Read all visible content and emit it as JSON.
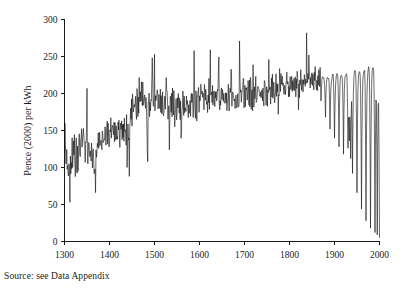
{
  "source_note": "Source: see Data Appendix",
  "chart_data": {
    "type": "line",
    "title": "",
    "subtitle": "",
    "xlabel": "",
    "ylabel": "Pence (2000) per kWh",
    "xlim": [
      1300,
      2000
    ],
    "ylim": [
      0,
      300
    ],
    "xticks": [
      1300,
      1400,
      1500,
      1600,
      1700,
      1800,
      1900,
      2000
    ],
    "yticks": [
      0,
      50,
      100,
      150,
      200,
      250,
      300
    ],
    "grid": false,
    "legend": null,
    "legend_position": "none",
    "line_color": "#111111",
    "annotations": [],
    "series": [
      {
        "name": "Real price of energy",
        "x_start": 1300,
        "x_step": 1,
        "values": [
          118,
          160,
          125,
          112,
          122,
          108,
          101,
          97,
          106,
          99,
          100,
          95,
          53,
          100,
          104,
          113,
          96,
          131,
          104,
          96,
          122,
          101,
          135,
          113,
          97,
          119,
          128,
          108,
          99,
          118,
          110,
          104,
          127,
          142,
          120,
          132,
          118,
          133,
          150,
          126,
          143,
          120,
          153,
          127,
          141,
          123,
          112,
          132,
          118,
          137,
          207,
          124,
          117,
          112,
          132,
          108,
          118,
          104,
          127,
          111,
          107,
          131,
          118,
          104,
          128,
          112,
          97,
          116,
          66,
          115,
          104,
          125,
          113,
          131,
          120,
          140,
          127,
          137,
          122,
          144,
          128,
          150,
          133,
          147,
          135,
          152,
          139,
          128,
          145,
          131,
          147,
          136,
          150,
          140,
          155,
          141,
          152,
          138,
          149,
          136,
          147,
          139,
          152,
          141,
          155,
          142,
          150,
          140,
          153,
          144,
          156,
          143,
          152,
          146,
          140,
          152,
          147,
          139,
          151,
          138,
          150,
          142,
          155,
          147,
          139,
          152,
          145,
          157,
          148,
          140,
          153,
          145,
          152,
          143,
          157,
          146,
          138,
          151,
          144,
          156,
          88,
          120,
          147,
          139,
          152,
          145,
          160,
          150,
          172,
          158,
          181,
          168,
          190,
          175,
          165,
          186,
          172,
          196,
          181,
          206,
          190,
          176,
          198,
          184,
          173,
          195,
          182,
          207,
          191,
          178,
          200,
          186,
          210,
          193,
          180,
          202,
          188,
          172,
          194,
          181,
          205,
          190,
          176,
          199,
          186,
          108,
          165,
          183,
          171,
          195,
          181,
          168,
          190,
          176,
          199,
          186,
          253,
          210,
          195,
          181,
          203,
          189,
          176,
          198,
          185,
          172,
          194,
          181,
          205,
          190,
          177,
          199,
          186,
          173,
          196,
          183,
          170,
          192,
          179,
          202,
          188,
          175,
          197,
          184,
          171,
          193,
          180,
          203,
          231,
          196,
          182,
          169,
          191,
          178,
          201,
          187,
          174,
          196,
          183,
          170,
          192,
          179,
          202,
          188,
          175,
          197,
          165,
          151,
          175,
          162,
          186,
          172,
          159,
          181,
          168,
          190,
          177,
          163,
          186,
          173,
          196,
          124,
          160,
          183,
          170,
          192,
          179,
          166,
          188,
          175,
          198,
          185,
          172,
          194,
          181,
          204,
          190,
          177,
          199,
          186,
          173,
          195,
          182,
          205,
          191,
          178,
          200,
          187,
          174,
          196,
          183,
          206,
          192,
          179,
          201,
          188,
          175,
          197,
          184,
          207,
          193,
          180,
          202,
          189,
          176,
          198,
          185,
          208,
          194,
          181,
          203,
          190,
          177,
          199,
          186,
          209,
          196,
          182,
          204,
          191,
          178,
          200,
          187,
          210,
          197,
          183,
          205,
          192,
          179,
          201,
          188,
          211,
          198,
          184,
          206,
          193,
          180,
          202,
          189,
          212,
          199,
          185,
          207,
          194,
          181,
          258,
          203,
          190,
          177,
          199,
          186,
          209,
          196,
          182,
          204,
          191,
          178,
          200,
          187,
          210,
          197,
          183,
          205,
          192,
          179,
          201,
          188,
          211,
          198,
          184,
          206,
          193,
          180,
          238,
          202,
          189,
          212,
          199,
          185,
          207,
          194,
          181,
          203,
          190,
          213,
          200,
          186,
          208,
          195,
          182,
          204,
          191,
          214,
          201,
          187,
          209,
          196,
          183,
          205,
          192,
          215,
          202,
          188,
          210,
          197,
          184,
          206,
          193,
          216,
          203,
          189,
          211,
          198,
          185,
          207,
          194,
          217,
          204,
          190,
          212,
          199,
          186,
          240,
          208,
          195,
          218,
          205,
          191,
          213,
          200,
          187,
          209,
          196,
          219,
          206,
          192,
          214,
          201,
          188,
          210,
          197,
          220,
          207,
          193,
          215,
          202,
          189,
          211,
          226,
          221,
          208,
          194,
          216,
          203,
          190,
          212,
          199,
          222,
          209,
          195,
          217,
          204,
          191,
          213,
          200,
          223,
          210,
          196,
          218,
          205,
          192,
          214,
          201,
          224,
          211,
          197,
          219,
          206,
          193,
          215,
          202,
          225,
          212,
          198,
          220,
          207,
          194,
          216,
          203,
          226,
          213,
          199,
          221,
          208,
          195,
          217,
          204,
          227,
          214,
          200,
          222,
          209,
          196,
          218,
          205,
          228,
          215,
          201,
          223,
          210,
          197,
          219,
          206,
          229,
          216,
          202,
          224,
          211,
          198,
          220,
          207,
          230,
          217,
          203,
          225,
          212,
          199,
          221,
          208,
          231,
          218,
          204,
          226,
          213,
          200,
          222,
          209,
          232,
          219,
          205,
          227,
          214,
          201,
          223,
          210,
          233,
          220,
          206,
          228,
          215,
          202,
          224,
          211,
          234,
          221,
          207,
          229,
          216,
          203,
          225,
          212,
          235,
          222,
          208,
          230,
          217,
          204,
          226,
          213,
          236,
          223,
          209,
          231,
          218,
          205,
          227,
          214,
          237,
          224,
          210,
          232,
          219,
          206,
          228,
          215,
          238,
          225,
          211,
          233,
          220,
          207,
          229,
          216,
          239,
          226,
          212,
          234,
          221,
          208,
          230,
          217,
          240,
          227,
          213,
          235,
          222,
          209,
          231,
          218,
          241,
          228,
          214,
          236,
          223,
          210,
          232,
          219,
          242,
          229,
          215,
          237,
          224,
          211,
          233,
          220,
          243,
          230,
          216,
          238,
          225,
          212,
          234,
          221,
          244,
          231,
          217,
          239,
          226,
          213,
          235,
          222,
          245,
          232,
          218,
          240,
          227,
          214,
          236,
          223,
          246,
          233,
          219,
          241,
          228,
          215,
          237,
          224,
          247,
          234,
          220,
          242,
          229,
          216,
          238,
          225,
          248,
          235,
          221,
          243,
          230,
          217,
          239,
          226,
          249,
          236,
          222,
          244,
          231,
          218,
          240,
          227,
          250,
          237,
          223,
          245,
          232,
          219,
          241,
          228,
          251,
          238,
          224,
          246,
          233,
          220,
          242,
          229,
          252,
          239,
          225,
          247,
          234,
          221,
          243,
          230,
          253
        ]
      }
    ]
  }
}
